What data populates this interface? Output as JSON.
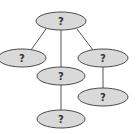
{
  "diagram": {
    "type": "tree",
    "colors": {
      "node_fill": "#d9d9d9",
      "node_stroke": "#4a4a4a",
      "edge": "#555555",
      "label": "#333333"
    },
    "nodes": [
      {
        "id": "root",
        "label": "?",
        "cx": 61,
        "cy": 21,
        "rx": 25,
        "ry": 9
      },
      {
        "id": "left",
        "label": "?",
        "cx": 22,
        "cy": 58,
        "rx": 24,
        "ry": 9
      },
      {
        "id": "middle",
        "label": "?",
        "cx": 61,
        "cy": 76,
        "rx": 24,
        "ry": 9
      },
      {
        "id": "right",
        "label": "?",
        "cx": 103,
        "cy": 58,
        "rx": 25,
        "ry": 9
      },
      {
        "id": "right-child",
        "label": "?",
        "cx": 103,
        "cy": 97,
        "rx": 25,
        "ry": 9
      },
      {
        "id": "bottom",
        "label": "?",
        "cx": 61,
        "cy": 119,
        "rx": 24,
        "ry": 9
      }
    ],
    "edges": [
      {
        "from": "root",
        "to": "left"
      },
      {
        "from": "root",
        "to": "middle"
      },
      {
        "from": "root",
        "to": "right"
      },
      {
        "from": "right",
        "to": "right-child"
      },
      {
        "from": "middle",
        "to": "bottom"
      }
    ]
  }
}
